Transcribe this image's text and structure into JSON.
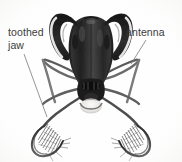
{
  "figure": {
    "name": "insect-head-anatomy-figure",
    "width": 182,
    "height": 162,
    "background_color": "#fefefe"
  },
  "annotations": [
    {
      "id": "toothed-jaw",
      "text_line1": "toothed",
      "text_line2": "jaw",
      "full_text": "toothed jaw",
      "text_color": "#3b3b3b",
      "position": "left",
      "leader_from": [
        24,
        54
      ],
      "leader_to": [
        47,
        117
      ]
    },
    {
      "id": "antenna",
      "text_line1": "antenna",
      "text_line2": "",
      "full_text": "antenna",
      "text_color": "#3b3b3b",
      "position": "right",
      "leader_from": [
        146,
        40
      ],
      "leader_to": [
        131,
        64
      ]
    }
  ],
  "specimen": {
    "head_color": "#2b2b2b",
    "mandible_highlight_color": "#f2f2f2",
    "leg_color": "#6e6e6e",
    "abdomen_color": "#e8e6e2",
    "outline_color": "#1a1a1a",
    "parts": [
      "left mandible",
      "right mandible",
      "head capsule",
      "antenna",
      "thorax",
      "legs",
      "toothed jaw comb"
    ]
  }
}
